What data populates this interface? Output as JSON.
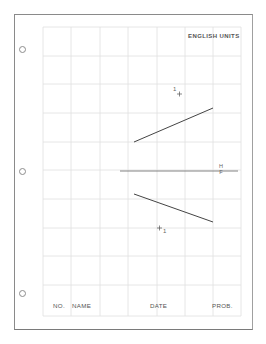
{
  "sheet": {
    "header": {
      "units_label": "ENGLISH UNITS"
    },
    "title_block": {
      "number_label": "NO.",
      "name_label": "NAME",
      "date_label": "DATE",
      "problem_label": "PROB."
    },
    "grid": {
      "columns": 7,
      "rows": 10,
      "line_color": "#e2e2e2"
    },
    "binder_holes": 3
  },
  "drawing": {
    "folding_line": {
      "upper_label": "H",
      "lower_label": "F"
    },
    "top_view_point_label": "1",
    "front_view_point_label": "1",
    "line_color": "#444444"
  }
}
